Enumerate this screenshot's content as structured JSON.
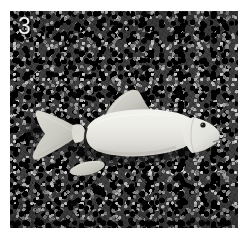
{
  "figure": {
    "panel_label": "3",
    "label_color": "#f2f2f2",
    "alt_description": "Grayscale photograph of a pale fish specimen lying on dark gravel substrate, with the caudal fin, dorsal fin and anal fin detached and placed beside the body.",
    "photo": {
      "background_name": "dark-gravel-substrate",
      "background_color": "#4e4e4e",
      "border_color": "#ffffff"
    },
    "specimen": {
      "name": "fish-specimen",
      "body_color": "#e9e9e4",
      "shadow_color": "#1c1c1c",
      "orientation": "head-right",
      "parts": [
        {
          "id": "body",
          "label": "fish-body",
          "color": "#eaeae5"
        },
        {
          "id": "head",
          "label": "fish-head",
          "color": "#e4e4df"
        },
        {
          "id": "caudal-fin",
          "label": "caudal-fin-detached",
          "color": "#c9c9c2"
        },
        {
          "id": "dorsal-fin",
          "label": "dorsal-fin-detached",
          "color": "#d2d2cb"
        },
        {
          "id": "anal-fin",
          "label": "anal-fin-detached",
          "color": "#c6c6bf"
        },
        {
          "id": "eye",
          "label": "fish-eye",
          "color": "#1a1a1a"
        }
      ]
    }
  }
}
